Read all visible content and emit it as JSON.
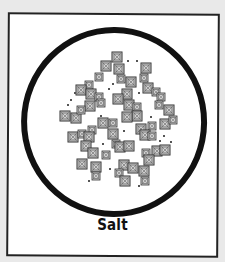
{
  "illustration": {
    "subject": "salt crystals under magnification",
    "caption": "Salt",
    "frame_color": "#222222",
    "circle_color": "#111111",
    "crystal_fill": "#cfcfcf",
    "crystal_stroke": "#333333"
  }
}
